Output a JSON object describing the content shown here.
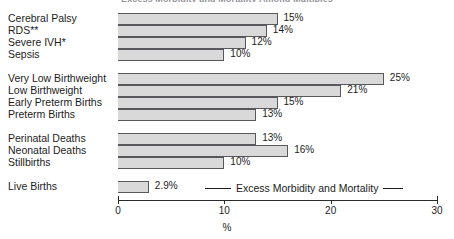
{
  "chart_data": {
    "type": "bar",
    "orientation": "horizontal",
    "title": "Excess Morbidity and Mortality Among Multiples",
    "xlabel": "%",
    "ylabel": "",
    "xlim": [
      0,
      30
    ],
    "xticks": [
      0,
      10,
      20,
      30
    ],
    "xtick_labels": [
      "0",
      "10",
      "20",
      "30"
    ],
    "grid": false,
    "legend_position": "inside-bottom",
    "legend": [
      "Excess Morbidity and Mortality"
    ],
    "categories": [
      "Cerebral Palsy",
      "RDS**",
      "Severe IVH*",
      "Sepsis",
      "Very Low Birthweight",
      "Low Birthweight",
      "Early Preterm Births",
      "Preterm Births",
      "Perinatal Deaths",
      "Neonatal Deaths",
      "Stillbirths",
      "Live Births"
    ],
    "values": [
      15,
      14,
      12,
      10,
      25,
      21,
      15,
      13,
      13,
      16,
      10,
      2.9
    ],
    "value_labels": [
      "15%",
      "14%",
      "12%",
      "10%",
      "25%",
      "21%",
      "15%",
      "13%",
      "13%",
      "16%",
      "10%",
      "2.9%"
    ],
    "groups": [
      {
        "name": "morbidity",
        "categories": [
          "Cerebral Palsy",
          "RDS**",
          "Severe IVH*",
          "Sepsis"
        ]
      },
      {
        "name": "birthweight-preterm",
        "categories": [
          "Very Low Birthweight",
          "Low Birthweight",
          "Early Preterm Births",
          "Preterm Births"
        ]
      },
      {
        "name": "mortality",
        "categories": [
          "Perinatal Deaths",
          "Neonatal Deaths",
          "Stillbirths"
        ]
      },
      {
        "name": "baseline",
        "categories": [
          "Live Births"
        ]
      }
    ],
    "colors": {
      "bar_fill": "#d9d9d9",
      "bar_border": "#58585c",
      "axis": "#2b2b2b",
      "text": "#1c1c1c"
    },
    "footnotes": [
      "* Severe IVH",
      "** RDS"
    ]
  },
  "rows": [
    {
      "label": "Cerebral Palsy",
      "value": 15,
      "value_label": "15%",
      "spacer_after": false
    },
    {
      "label": "RDS**",
      "value": 14,
      "value_label": "14%",
      "spacer_after": false
    },
    {
      "label": "Severe IVH*",
      "value": 12,
      "value_label": "12%",
      "spacer_after": false
    },
    {
      "label": "Sepsis",
      "value": 10,
      "value_label": "10%",
      "spacer_after": true
    },
    {
      "label": "Very Low Birthweight",
      "value": 25,
      "value_label": "25%",
      "spacer_after": false
    },
    {
      "label": "Low Birthweight",
      "value": 21,
      "value_label": "21%",
      "spacer_after": false
    },
    {
      "label": "Early Preterm Births",
      "value": 15,
      "value_label": "15%",
      "spacer_after": false
    },
    {
      "label": "Preterm Births",
      "value": 13,
      "value_label": "13%",
      "spacer_after": true
    },
    {
      "label": "Perinatal Deaths",
      "value": 13,
      "value_label": "13%",
      "spacer_after": false
    },
    {
      "label": "Neonatal Deaths",
      "value": 16,
      "value_label": "16%",
      "spacer_after": false
    },
    {
      "label": "Stillbirths",
      "value": 10,
      "value_label": "10%",
      "spacer_after": true
    },
    {
      "label": "Live Births",
      "value": 2.9,
      "value_label": "2.9%",
      "spacer_after": false
    }
  ],
  "axis": {
    "ticks": [
      "0",
      "10",
      "20",
      "30"
    ],
    "title": "%"
  },
  "legend": {
    "text": "Excess Morbidity and Mortality"
  },
  "title": {
    "text": "Excess Morbidity and Mortality Among Multiples"
  }
}
